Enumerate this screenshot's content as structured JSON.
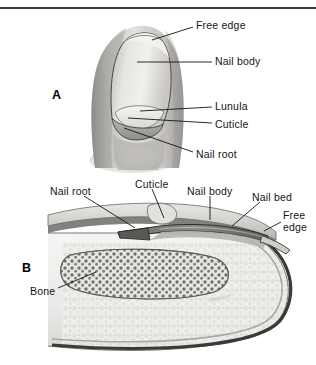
{
  "figure": {
    "top_rule_color": "#3a3a3a",
    "background": "#ffffff",
    "ink_color": "#141414"
  },
  "panels": [
    {
      "id": "A",
      "letter": "A",
      "view": "surface view of fingertip and nail",
      "letter_pos": {
        "x": 52,
        "y": 88
      },
      "labels": [
        {
          "name": "free-edge",
          "text": "Free edge",
          "x": 196,
          "y": 20,
          "leader": [
            [
              193,
              27
            ],
            [
              152,
              40
            ]
          ]
        },
        {
          "name": "nail-body",
          "text": "Nail body",
          "x": 215,
          "y": 56,
          "leader": [
            [
              212,
              62
            ],
            [
              137,
              62
            ]
          ]
        },
        {
          "name": "lunula",
          "text": "Lunula",
          "x": 215,
          "y": 101,
          "leader": [
            [
              212,
              107
            ],
            [
              140,
              111
            ]
          ]
        },
        {
          "name": "cuticle",
          "text": "Cuticle",
          "x": 215,
          "y": 119,
          "leader": [
            [
              212,
              123
            ],
            [
              128,
              118
            ]
          ]
        },
        {
          "name": "nail-root",
          "text": "Nail root",
          "x": 196,
          "y": 149,
          "leader": [
            [
              193,
              152
            ],
            [
              124,
              128
            ]
          ]
        }
      ]
    },
    {
      "id": "B",
      "letter": "B",
      "view": "sagittal section of fingertip",
      "letter_pos": {
        "x": 22,
        "y": 261
      },
      "labels": [
        {
          "name": "nail-root",
          "text": "Nail root",
          "x": 50,
          "y": 186,
          "leader": [
            [
              84,
              196
            ],
            [
              135,
              228
            ]
          ]
        },
        {
          "name": "cuticle",
          "text": "Cuticle",
          "x": 135,
          "y": 179,
          "leader": [
            [
              152,
              189
            ],
            [
              164,
              218
            ]
          ]
        },
        {
          "name": "nail-body",
          "text": "Nail body",
          "x": 187,
          "y": 186,
          "leader": [
            [
              210,
              196
            ],
            [
              210,
              220
            ]
          ]
        },
        {
          "name": "nail-bed",
          "text": "Nail bed",
          "x": 252,
          "y": 192,
          "leader": [
            [
              260,
              202
            ],
            [
              232,
              226
            ]
          ]
        },
        {
          "name": "free-edge",
          "text": "Free\nedge",
          "x": 283,
          "y": 210,
          "leader": [
            [
              281,
              222
            ],
            [
              264,
              230
            ]
          ]
        },
        {
          "name": "bone",
          "text": "Bone",
          "x": 30,
          "y": 286,
          "leader": [
            [
              58,
              288
            ],
            [
              96,
              272
            ]
          ]
        }
      ]
    }
  ],
  "artist_signature": {
    "text": "Dickerson",
    "x": 210,
    "y": 295
  },
  "palette": {
    "nail_plate": "#d7d5d2",
    "nail_plate_light": "#eceae7",
    "skin": "#cfcdca",
    "skin_shadow": "#9b9996",
    "tissue_light": "#efeeec",
    "dermis": "#8e8c8a",
    "bone_fill": "#f2f1ef",
    "bone_marrow": "#4a4846",
    "outline": "#3a3835"
  }
}
